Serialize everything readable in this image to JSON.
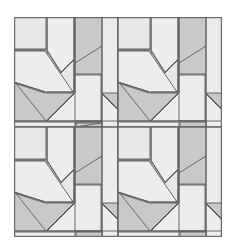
{
  "figure": {
    "kind": "quilt-block-pattern-diagram",
    "title": "",
    "background_color": "#ffffff"
  },
  "canvas": {
    "width": 236,
    "height": 249,
    "quilt_left": 14,
    "quilt_top": 17,
    "quilt_width": 208,
    "quilt_height": 220
  },
  "palette": {
    "light": "#ececed",
    "light_alt": "#e4e4e5",
    "medium": "#c9c9c9",
    "dark": "#b4b4b4",
    "outline": "#5a5a5a",
    "border": "#6b6b6b",
    "background": "#ffffff"
  },
  "layout": {
    "rows": 2,
    "columns": 2,
    "total_blocks": 4,
    "block_units": 4,
    "block_width": 104,
    "block_height": 110,
    "repeat": "identical",
    "rotation_degrees": 0
  },
  "blocks": [
    {
      "id": "block-1",
      "position": "top-left",
      "row": 1,
      "column": 1
    },
    {
      "id": "block-2",
      "position": "top-right",
      "row": 1,
      "column": 2
    },
    {
      "id": "block-3",
      "position": "bottom-left",
      "row": 2,
      "column": 1
    },
    {
      "id": "block-4",
      "position": "bottom-right",
      "row": 2,
      "column": 2
    }
  ],
  "block_pieces": [
    {
      "name": "corner-square-top-left",
      "shade": "light",
      "color": "#ececed"
    },
    {
      "name": "petal-left-upper",
      "shade": "light",
      "color": "#ececed"
    },
    {
      "name": "petal-right-upper",
      "shade": "medium",
      "color": "#c9c9c9"
    },
    {
      "name": "petal-center-left",
      "shade": "light",
      "color": "#ececed"
    },
    {
      "name": "petal-center-right",
      "shade": "medium",
      "color": "#c9c9c9"
    },
    {
      "name": "leaf-upper-left",
      "shade": "light",
      "color": "#ececed"
    },
    {
      "name": "leaf-lower-left",
      "shade": "medium",
      "color": "#c9c9c9"
    },
    {
      "name": "stem-diagonal",
      "shade": "light",
      "color": "#ececed"
    },
    {
      "name": "center-square",
      "shade": "light",
      "color": "#ececed"
    },
    {
      "name": "side-triangle-right",
      "shade": "medium",
      "color": "#c9c9c9"
    },
    {
      "name": "base-triangle-bottom",
      "shade": "medium",
      "color": "#c9c9c9"
    },
    {
      "name": "filler-square-bottom-left",
      "shade": "light",
      "color": "#ececed"
    },
    {
      "name": "filler-square-bottom-right",
      "shade": "light",
      "color": "#ececed"
    }
  ]
}
